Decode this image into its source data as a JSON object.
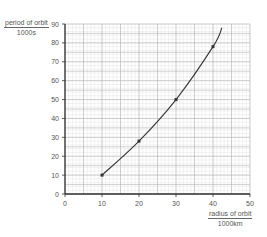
{
  "chart_data": {
    "type": "line",
    "title": "",
    "xlabel": "radius of orbit / 1000km",
    "ylabel": "period of orbit / 1000s",
    "xlabel_parts": {
      "top": "radius of orbit",
      "bottom": "1000km"
    },
    "ylabel_parts": {
      "top": "period of orbit",
      "bottom": "1000s"
    },
    "xlim": [
      0,
      50
    ],
    "ylim": [
      0,
      90
    ],
    "x_ticks": [
      0,
      10,
      20,
      30,
      40,
      50
    ],
    "y_ticks": [
      0,
      10,
      20,
      30,
      40,
      50,
      60,
      70,
      80,
      90
    ],
    "grid": {
      "major_x": 5,
      "major_y": 10,
      "minor": 1
    },
    "legend": null,
    "series": [
      {
        "name": "period of orbit",
        "points": [
          [
            10,
            10
          ],
          [
            20,
            28
          ],
          [
            30,
            50
          ],
          [
            40,
            78
          ]
        ],
        "curve_end": [
          42.4,
          88
        ],
        "markers": true
      }
    ]
  }
}
